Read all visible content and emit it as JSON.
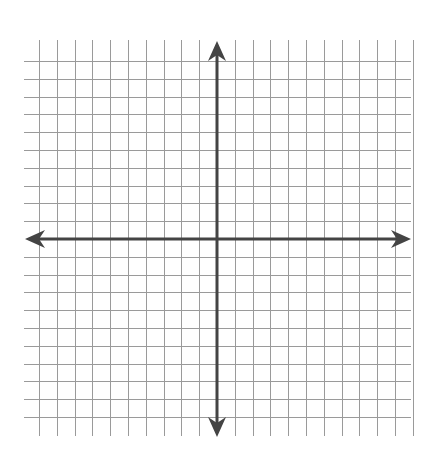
{
  "diagram": {
    "type": "coordinate-plane",
    "canvas": {
      "width": 431,
      "height": 454
    },
    "origin": {
      "x": 217,
      "y": 239
    },
    "cell_size": 17.8,
    "grid": {
      "cells_left": 10,
      "cells_right": 11,
      "cells_up": 10,
      "cells_down": 10,
      "vertical_line_span": {
        "y1": 40,
        "y2": 436
      },
      "horizontal_line_span": {
        "x1": 24,
        "x2": 411
      },
      "color": "#9a9a9a"
    },
    "axes": {
      "color": "#444444",
      "x_axis": {
        "x1": 25,
        "x2": 411,
        "arrows": [
          "left",
          "right"
        ]
      },
      "y_axis": {
        "y1": 41,
        "y2": 437,
        "arrows": [
          "up",
          "down"
        ]
      }
    },
    "labels": []
  }
}
